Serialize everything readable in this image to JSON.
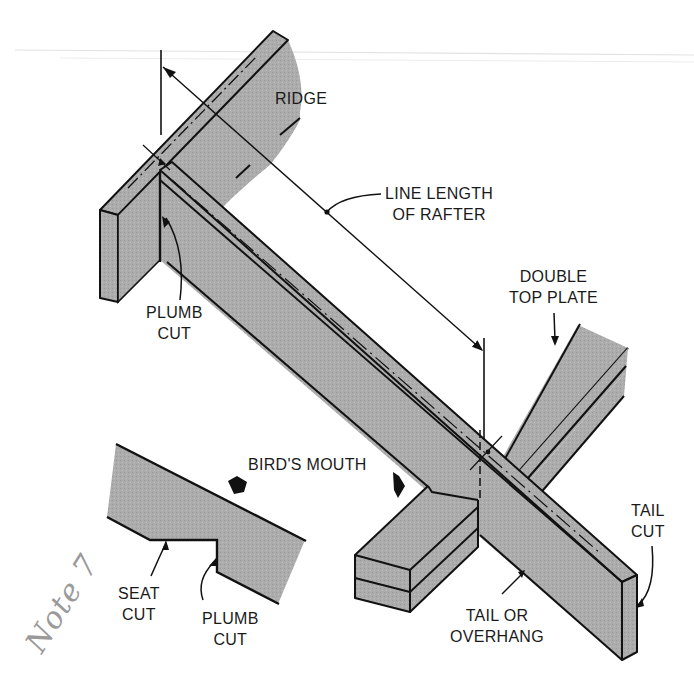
{
  "figure": {
    "colors": {
      "wood_fill": "#a9a9a9",
      "wood_fill_light": "#b8b8b8",
      "stroke": "#111111",
      "background": "#ffffff",
      "scan_line": "#dedede",
      "handwriting": "#9a9a9a"
    }
  },
  "labels": {
    "ridge": "RIDGE",
    "line_length": {
      "line1": "LINE LENGTH",
      "line2": "OF RAFTER"
    },
    "double_top_plate": {
      "line1": "DOUBLE",
      "line2": "TOP PLATE"
    },
    "plumb_cut_main": {
      "line1": "PLUMB",
      "line2": "CUT"
    },
    "birds_mouth": "BIRD'S MOUTH",
    "seat_cut": {
      "line1": "SEAT",
      "line2": "CUT"
    },
    "plumb_cut_detail": {
      "line1": "PLUMB",
      "line2": "CUT"
    },
    "tail_or_overhang": {
      "line1": "TAIL OR",
      "line2": "OVERHANG"
    },
    "tail_cut": {
      "line1": "TAIL",
      "line2": "CUT"
    }
  },
  "annotations": {
    "handwritten_note": "Note 7"
  }
}
